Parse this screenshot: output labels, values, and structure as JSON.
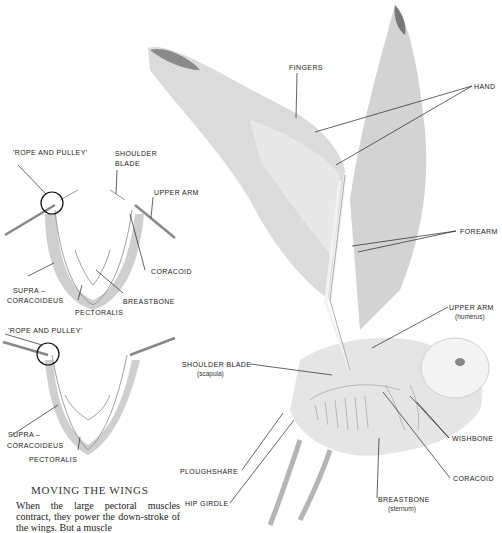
{
  "diagram": {
    "bird_labels": {
      "fingers": "FINGERS",
      "hand": "HAND",
      "forearm": "FOREARM",
      "upper_arm": "UPPER ARM",
      "upper_arm_sub": "(humerus)",
      "shoulder_blade": "SHOULDER BLADE",
      "shoulder_blade_sub": "(scapula)",
      "wishbone": "WISHBONE",
      "coracoid": "CORACOID",
      "breastbone": "BREASTBONE",
      "breastbone_sub": "(sternum)",
      "ploughshare": "PLOUGHSHARE",
      "hip_girdle": "HIP GIRDLE"
    },
    "top_inset": {
      "rope_pulley": "'ROPE AND PULLEY'",
      "shoulder": "SHOULDER",
      "blade": "BLADE",
      "upper_arm": "UPPER ARM",
      "coracoid": "CORACOID",
      "supra": "SUPRA –",
      "coracoideus": "CORACOIDEUS",
      "breastbone": "BREASTBONE",
      "pectoralis": "PECTORALIS"
    },
    "bottom_inset": {
      "rope_pulley": "'ROPE AND PULLEY'",
      "supra": "SUPRA –",
      "coracoideus": "CORACOIDEUS",
      "pectoralis": "PECTORALIS"
    },
    "caption": {
      "title": "MOVING THE WINGS",
      "text": "When the large pectoral muscles contract, they power the down-stroke of the wings. But a muscle"
    }
  }
}
